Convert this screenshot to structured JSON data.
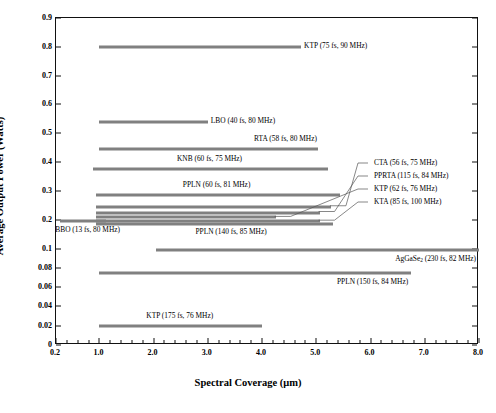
{
  "chart_data": {
    "type": "bar",
    "orientation": "horizontal-range",
    "title": "",
    "xlabel": "Spectral Coverage (μm)",
    "ylabel": "Average Output Power (Watts)",
    "xlim": [
      0.2,
      8.0
    ],
    "ylim": [
      0,
      0.9
    ],
    "grid": false,
    "legend": "none",
    "y_axis_note": "Non-uniform scale: 0 to 0.1 in steps of 0.02, then 0.1 to 0.9 in steps of 0.1",
    "xticks": [
      "0.2",
      "1.0",
      "2.0",
      "3.0",
      "4.0",
      "5.0",
      "6.0",
      "7.0",
      "8.0"
    ],
    "xtick_values": [
      0.2,
      1.0,
      2.0,
      3.0,
      4.0,
      5.0,
      6.0,
      7.0,
      8.0
    ],
    "yticks": [
      "0",
      "0.02",
      "0.04",
      "0.06",
      "0.08",
      "0.1",
      "0.2",
      "0.3",
      "0.4",
      "0.5",
      "0.6",
      "0.7",
      "0.8",
      "0.9"
    ],
    "ytick_values": [
      0,
      0.02,
      0.04,
      0.06,
      0.08,
      0.1,
      0.2,
      0.3,
      0.4,
      0.5,
      0.6,
      0.7,
      0.8,
      0.9
    ],
    "bars": [
      {
        "label": "KTP (75 fs, 90 MHz)",
        "material": "KTP",
        "pulse_fs": 75,
        "rep_rate_MHz": 90,
        "power_W": 0.8,
        "x_start": 1.0,
        "x_end": 4.72,
        "label_side": "right"
      },
      {
        "label": "LBO (40 fs, 80 MHz)",
        "material": "LBO",
        "pulse_fs": 40,
        "rep_rate_MHz": 80,
        "power_W": 0.54,
        "x_start": 1.0,
        "x_end": 3.0,
        "label_side": "right"
      },
      {
        "label": "RTA (58 fs, 80 MHz)",
        "material": "RTA",
        "pulse_fs": 58,
        "rep_rate_MHz": 80,
        "power_W": 0.445,
        "x_start": 1.0,
        "x_end": 5.03,
        "label_side": "above-right"
      },
      {
        "label": "KNB (60 fs, 75 MHz)",
        "material": "KNB",
        "pulse_fs": 60,
        "rep_rate_MHz": 75,
        "power_W": 0.375,
        "x_start": 0.88,
        "x_end": 5.22,
        "label_side": "above-mid"
      },
      {
        "label": "PPLN (60 fs, 81 MHz)",
        "material": "PPLN",
        "pulse_fs": 60,
        "rep_rate_MHz": 81,
        "power_W": 0.285,
        "x_start": 0.93,
        "x_end": 5.43,
        "label_side": "above-mid"
      },
      {
        "label": "CTA (56 fs, 75 MHz)",
        "material": "CTA",
        "pulse_fs": 56,
        "rep_rate_MHz": 75,
        "power_W": 0.245,
        "x_start": 0.93,
        "x_end": 5.27,
        "label_side": "leader"
      },
      {
        "label": "PPRTA (115 fs, 84 MHz)",
        "material": "PPRTA",
        "pulse_fs": 115,
        "rep_rate_MHz": 84,
        "power_W": 0.225,
        "x_start": 0.93,
        "x_end": 5.06,
        "label_side": "leader"
      },
      {
        "label": "KTP (62 fs, 76 MHz)",
        "material": "KTP",
        "pulse_fs": 62,
        "rep_rate_MHz": 76,
        "power_W": 0.208,
        "x_start": 0.93,
        "x_end": 4.25,
        "label_side": "leader"
      },
      {
        "label": "KTA (85 fs, 100 MHz)",
        "material": "KTA",
        "pulse_fs": 85,
        "rep_rate_MHz": 100,
        "power_W": 0.195,
        "x_start": 0.93,
        "x_end": 5.06,
        "label_side": "leader"
      },
      {
        "label": "PPLN (140 fs, 85 MHz)",
        "material": "PPLN",
        "pulse_fs": 140,
        "rep_rate_MHz": 85,
        "power_W": 0.185,
        "x_start": 0.93,
        "x_end": 5.3,
        "label_side": "below-mid"
      },
      {
        "label": "BBO (13 fs, 80 MHz)",
        "material": "BBO",
        "pulse_fs": 13,
        "rep_rate_MHz": 80,
        "power_W": 0.195,
        "x_start": 0.28,
        "x_end": 1.13,
        "label_side": "below-left"
      },
      {
        "label": "AgGaSe₂ (230 fs, 82 MHz)",
        "material": "AgGaSe2",
        "pulse_fs": 230,
        "rep_rate_MHz": 82,
        "power_W": 0.098,
        "x_start": 2.05,
        "x_end": 8.0,
        "label_side": "below-right"
      },
      {
        "label": "PPLN (150 fs, 84 MHz)",
        "material": "PPLN",
        "pulse_fs": 150,
        "rep_rate_MHz": 84,
        "power_W": 0.075,
        "x_start": 1.0,
        "x_end": 6.75,
        "label_side": "below-right"
      },
      {
        "label": "KTP (175 fs, 76 MHz)",
        "material": "KTP",
        "pulse_fs": 175,
        "rep_rate_MHz": 76,
        "power_W": 0.02,
        "x_start": 1.0,
        "x_end": 4.0,
        "label_side": "above-mid"
      }
    ],
    "series_color": "#808080"
  }
}
